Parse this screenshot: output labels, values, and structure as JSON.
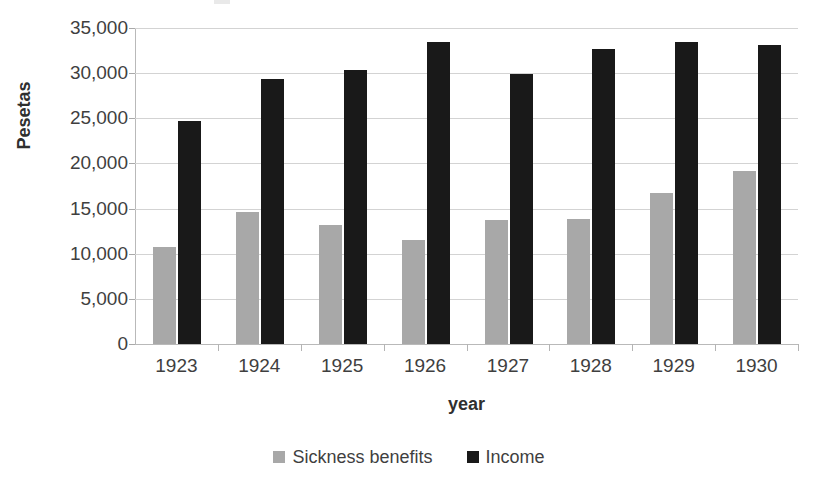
{
  "chart_data": {
    "type": "bar",
    "title": "",
    "xlabel": "year",
    "ylabel": "Pesetas",
    "categories": [
      "1923",
      "1924",
      "1925",
      "1926",
      "1927",
      "1928",
      "1929",
      "1930"
    ],
    "series": [
      {
        "name": "Sickness benefits",
        "color": "#a8a8a8",
        "values": [
          10800,
          14600,
          13200,
          11500,
          13700,
          13800,
          16700,
          19200
        ]
      },
      {
        "name": "Income",
        "color": "#191919",
        "values": [
          24700,
          29300,
          30300,
          33400,
          29900,
          32700,
          33500,
          33100
        ]
      }
    ],
    "ylim": [
      0,
      35000
    ],
    "ytick_values": [
      0,
      5000,
      10000,
      15000,
      20000,
      25000,
      30000,
      35000
    ],
    "ytick_labels": [
      "0",
      "5,000",
      "10,000",
      "15,000",
      "20,000",
      "25,000",
      "30,000",
      "35,000"
    ],
    "grid": true,
    "legend_position": "bottom"
  },
  "legend": {
    "entries": [
      {
        "label": "Sickness benefits",
        "swatch": "gray-square-icon"
      },
      {
        "label": "Income",
        "swatch": "black-square-icon"
      }
    ]
  },
  "colors": {
    "sickness_benefits": "#a8a8a8",
    "income": "#191919",
    "gridline": "#d3d3d3",
    "axis": "#b9b9b9",
    "text": "#3f3f3f",
    "background": "#ffffff"
  }
}
